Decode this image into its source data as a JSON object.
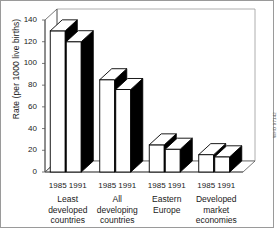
{
  "chart_data": {
    "type": "bar",
    "title": "",
    "subtitle": "",
    "xlabel": "",
    "ylabel": "Rate (per 1000 live births)",
    "ylim": [
      0,
      140
    ],
    "ytick_step": 20,
    "yticks": [
      "0",
      "20",
      "40",
      "60",
      "80",
      "100",
      "120",
      "140"
    ],
    "grid": false,
    "legend": "none",
    "style": "3d-grouped-bar",
    "categories": [
      "Least developed countries",
      "All developing countries",
      "Eastern Europe",
      "Developed market economies"
    ],
    "category_lines": [
      [
        "Least",
        "developed",
        "countries"
      ],
      [
        "All",
        "developing",
        "countries"
      ],
      [
        "Eastern",
        "Europe"
      ],
      [
        "Developed",
        "market",
        "economies"
      ]
    ],
    "series": [
      {
        "name": "1985",
        "values": [
          130,
          85,
          25,
          16
        ]
      },
      {
        "name": "1991",
        "values": [
          120,
          76,
          21,
          14
        ]
      }
    ],
    "year_labels": [
      "1985",
      "1991"
    ],
    "annotations": [],
    "credit": "WHO 97142"
  },
  "colors": {
    "bar_face": "#ffffff",
    "bar_side": "#000000",
    "bar_outline": "#000000",
    "axis": "#555555",
    "frame": "#9a9a9a",
    "text": "#1a1a1a"
  }
}
